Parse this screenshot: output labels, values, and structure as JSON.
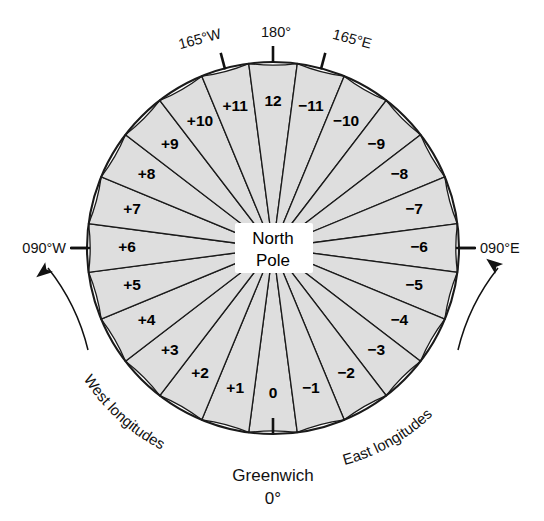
{
  "figure": {
    "center_label_line1": "North",
    "center_label_line2": "Pole",
    "colors": {
      "sector_fill": "#dedede",
      "line": "#1a1a1a",
      "text": "#000000",
      "background": "#ffffff"
    }
  },
  "edge_labels": {
    "top_left": "165°W",
    "top_center": "180°",
    "top_right": "165°E",
    "left": "090°W",
    "right": "090°E",
    "bottom_line1": "Greenwich",
    "bottom_line2": "0°"
  },
  "curved_labels": {
    "west": "West longitudes",
    "east": "East longitudes"
  },
  "chart_data": {
    "type": "pie",
    "slice_count": 24,
    "slice_width_degrees": 15,
    "categories": [
      "0",
      "+1",
      "+2",
      "+3",
      "+4",
      "+5",
      "+6",
      "+7",
      "+8",
      "+9",
      "+10",
      "+11",
      "12",
      "−11",
      "−10",
      "−9",
      "−8",
      "−7",
      "−6",
      "−5",
      "−4",
      "−3",
      "−2",
      "−1"
    ],
    "values": [
      15,
      15,
      15,
      15,
      15,
      15,
      15,
      15,
      15,
      15,
      15,
      15,
      15,
      15,
      15,
      15,
      15,
      15,
      15,
      15,
      15,
      15,
      15,
      15
    ],
    "sectors": [
      {
        "label": "0",
        "center_longitude": "0°",
        "hemisphere": "meridian"
      },
      {
        "label": "+1",
        "center_longitude": "015°W",
        "hemisphere": "west"
      },
      {
        "label": "+2",
        "center_longitude": "030°W",
        "hemisphere": "west"
      },
      {
        "label": "+3",
        "center_longitude": "045°W",
        "hemisphere": "west"
      },
      {
        "label": "+4",
        "center_longitude": "060°W",
        "hemisphere": "west"
      },
      {
        "label": "+5",
        "center_longitude": "075°W",
        "hemisphere": "west"
      },
      {
        "label": "+6",
        "center_longitude": "090°W",
        "hemisphere": "west"
      },
      {
        "label": "+7",
        "center_longitude": "105°W",
        "hemisphere": "west"
      },
      {
        "label": "+8",
        "center_longitude": "120°W",
        "hemisphere": "west"
      },
      {
        "label": "+9",
        "center_longitude": "135°W",
        "hemisphere": "west"
      },
      {
        "label": "+10",
        "center_longitude": "150°W",
        "hemisphere": "west"
      },
      {
        "label": "+11",
        "center_longitude": "165°W",
        "hemisphere": "west"
      },
      {
        "label": "12",
        "center_longitude": "180°",
        "hemisphere": "meridian"
      },
      {
        "label": "−11",
        "center_longitude": "165°E",
        "hemisphere": "east"
      },
      {
        "label": "−10",
        "center_longitude": "150°E",
        "hemisphere": "east"
      },
      {
        "label": "−9",
        "center_longitude": "135°E",
        "hemisphere": "east"
      },
      {
        "label": "−8",
        "center_longitude": "120°E",
        "hemisphere": "east"
      },
      {
        "label": "−7",
        "center_longitude": "105°E",
        "hemisphere": "east"
      },
      {
        "label": "−6",
        "center_longitude": "090°E",
        "hemisphere": "east"
      },
      {
        "label": "−5",
        "center_longitude": "075°E",
        "hemisphere": "east"
      },
      {
        "label": "−4",
        "center_longitude": "060°E",
        "hemisphere": "east"
      },
      {
        "label": "−3",
        "center_longitude": "045°E",
        "hemisphere": "east"
      },
      {
        "label": "−2",
        "center_longitude": "030°E",
        "hemisphere": "east"
      },
      {
        "label": "−1",
        "center_longitude": "015°E",
        "hemisphere": "east"
      }
    ],
    "tick_marks": [
      "165°W",
      "180°",
      "165°E",
      "090°W",
      "090°E",
      "0°"
    ],
    "legend": [
      "West longitudes",
      "East longitudes"
    ],
    "grid": false,
    "legend_position": "outer arc, bottom left and bottom right"
  }
}
